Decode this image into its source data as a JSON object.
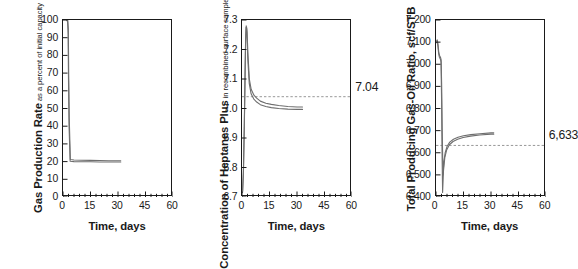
{
  "figure": {
    "panel_count": 3
  },
  "chart_data": [
    {
      "type": "line",
      "title": "",
      "ylabel_main": "Gas Production Rate",
      "ylabel_sub": "as a percent of initial capacity",
      "xlabel": "Time, days",
      "xlim": [
        0,
        60
      ],
      "ylim": [
        0,
        100
      ],
      "xticks": [
        0,
        15,
        30,
        45,
        60
      ],
      "xtick_labels": [
        "0",
        "15",
        "30",
        "45",
        "60"
      ],
      "yticks": [
        0,
        10,
        20,
        30,
        40,
        50,
        60,
        70,
        80,
        90,
        100
      ],
      "ytick_labels": [
        "0",
        "10",
        "20",
        "30",
        "40",
        "50",
        "60",
        "70",
        "80",
        "90",
        "100"
      ],
      "minor_xtick_step": 3,
      "grid": false,
      "legend": "none",
      "annotation": null,
      "reference_line": null,
      "series": [
        {
          "name": "upper-bound",
          "x": [
            2.0,
            2.6,
            2.9,
            3.1,
            3.4,
            4.0,
            6.0,
            10.0,
            15.0,
            20.0,
            25.0,
            30.0,
            31.5
          ],
          "values": [
            100,
            100,
            95,
            70,
            45,
            21.2,
            20.9,
            20.8,
            20.7,
            20.6,
            20.5,
            20.5,
            20.5
          ]
        },
        {
          "name": "lower-bound",
          "x": [
            2.0,
            2.5,
            2.8,
            3.0,
            3.3,
            3.9,
            6.0,
            10.0,
            15.0,
            20.0,
            25.0,
            30.0,
            31.5
          ],
          "values": [
            100,
            99,
            92,
            66,
            40,
            20.2,
            20.0,
            19.9,
            19.9,
            19.8,
            19.8,
            19.8,
            19.8
          ]
        }
      ]
    },
    {
      "type": "line",
      "title": "",
      "ylabel_main": "Concentration of Heptanes Plus",
      "ylabel_sub": "in recombined surface samples, mole percent",
      "xlabel": "Time, days",
      "xlim": [
        0,
        60
      ],
      "ylim": [
        6.7,
        7.3
      ],
      "xticks": [
        0,
        15,
        30,
        45,
        60
      ],
      "xtick_labels": [
        "0",
        "15",
        "30",
        "45",
        "60"
      ],
      "yticks": [
        6.7,
        6.8,
        6.9,
        7.0,
        7.1,
        7.2,
        7.3
      ],
      "ytick_labels": [
        "6.7",
        "6.8",
        "6.9",
        "7.0",
        "7.1",
        "7.2",
        "7.3"
      ],
      "minor_xtick_step": 3,
      "grid": false,
      "legend": "none",
      "annotation": {
        "text": "7.04",
        "value": 7.04
      },
      "reference_line": {
        "y": 7.04,
        "style": "dashed"
      },
      "series": [
        {
          "name": "upper-bound",
          "x": [
            0.35,
            0.8,
            1.3,
            1.7,
            2.0,
            2.3,
            2.7,
            3.2,
            4.0,
            5.0,
            6.5,
            8.0,
            10.0,
            13.0,
            16.0,
            20.0,
            25.0,
            30.0,
            33.0
          ],
          "values": [
            6.72,
            6.79,
            6.95,
            7.12,
            7.24,
            7.28,
            7.27,
            7.19,
            7.1,
            7.065,
            7.045,
            7.035,
            7.025,
            7.018,
            7.014,
            7.01,
            7.007,
            7.005,
            7.005
          ]
        },
        {
          "name": "lower-bound",
          "x": [
            0.3,
            0.75,
            1.25,
            1.65,
            1.95,
            2.25,
            2.65,
            3.15,
            3.95,
            4.95,
            6.45,
            8.0,
            10.0,
            13.0,
            16.0,
            20.0,
            25.0,
            30.0,
            33.0
          ],
          "values": [
            6.715,
            6.78,
            6.94,
            7.11,
            7.23,
            7.275,
            7.26,
            7.17,
            7.085,
            7.05,
            7.032,
            7.022,
            7.013,
            7.007,
            7.003,
            7.0,
            6.998,
            6.997,
            6.997
          ]
        }
      ]
    },
    {
      "type": "line",
      "title": "",
      "ylabel_main": "Total Producing Gas-Oil Ratio, scf/STB",
      "ylabel_sub": "",
      "xlabel": "Time, days",
      "xlim": [
        0,
        60
      ],
      "ylim": [
        6400,
        7200
      ],
      "xticks": [
        0,
        15,
        30,
        45,
        60
      ],
      "xtick_labels": [
        "0",
        "15",
        "30",
        "45",
        "60"
      ],
      "yticks": [
        6400,
        6500,
        6600,
        6700,
        6800,
        6900,
        7000,
        7100,
        7200
      ],
      "ytick_labels": [
        "6,400",
        "6,500",
        "6,600",
        "6,700",
        "6,800",
        "6,900",
        "7,000",
        "7,100",
        "7,200"
      ],
      "minor_xtick_step": 3,
      "grid": false,
      "legend": "none",
      "annotation": {
        "text": "6,633",
        "value": 6633
      },
      "reference_line": {
        "y": 6633,
        "style": "dashed"
      },
      "series": [
        {
          "name": "upper-bound",
          "x": [
            0.3,
            0.7,
            1.1,
            1.5,
            1.9,
            2.2,
            2.5,
            2.8,
            3.1,
            3.4,
            3.8,
            4.3,
            5.0,
            6.0,
            7.5,
            9.5,
            12.0,
            15.0,
            19.0,
            24.0,
            30.0,
            31.5
          ],
          "values": [
            7105,
            7110,
            7090,
            7055,
            7040,
            7035,
            7030,
            7020,
            6900,
            6700,
            6500,
            6560,
            6600,
            6628,
            6648,
            6661,
            6670,
            6677,
            6682,
            6686,
            6690,
            6690
          ]
        },
        {
          "name": "lower-bound",
          "x": [
            0.25,
            0.65,
            1.05,
            1.45,
            1.85,
            2.15,
            2.45,
            2.75,
            3.05,
            3.3,
            3.6,
            4.1,
            4.8,
            5.8,
            7.3,
            9.3,
            11.8,
            14.8,
            18.8,
            23.8,
            30.0,
            31.5
          ],
          "values": [
            7098,
            7102,
            7082,
            7048,
            7032,
            7027,
            7022,
            7010,
            6830,
            6600,
            6420,
            6520,
            6578,
            6612,
            6636,
            6651,
            6661,
            6669,
            6675,
            6680,
            6684,
            6684
          ]
        }
      ]
    }
  ],
  "style": {
    "axis_color": "#1a1a1a",
    "curve_color": "#6e6e6e",
    "dash_color": "#8c8c8c",
    "background": "#ffffff"
  }
}
